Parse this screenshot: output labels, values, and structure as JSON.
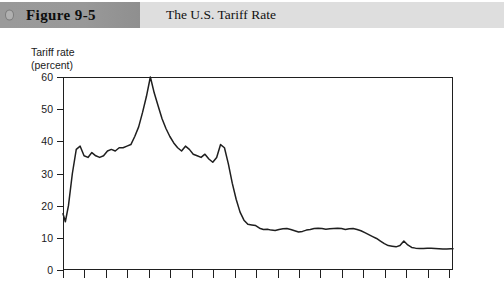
{
  "caption": {
    "figure_label": "Figure 9-5",
    "title": "The U.S. Tariff Rate",
    "band_color": "#999999",
    "title_band_color": "#dedede",
    "dot_icon": "circle-icon"
  },
  "chart_data": {
    "type": "line",
    "title": "The U.S. Tariff Rate",
    "xlabel": "",
    "ylabel": "Tariff rate\n(percent)",
    "ylim": [
      0,
      60
    ],
    "yticks": [
      0,
      10,
      20,
      30,
      40,
      50,
      60
    ],
    "ytick_labels": [
      "0",
      "10",
      "20",
      "30",
      "40",
      "50",
      "60"
    ],
    "xlim": [
      0,
      100
    ],
    "xticks": [
      0,
      5.5,
      11,
      16.5,
      22,
      27.5,
      33,
      38.5,
      44,
      49.5,
      55,
      60.5,
      66,
      71.5,
      77,
      82.5,
      88,
      93.5,
      99
    ],
    "xtick_labels": [],
    "grid": false,
    "legend": null,
    "line_color": "#1f1f1f",
    "x": [
      0.0,
      0.6,
      1.4,
      2.4,
      3.4,
      4.4,
      5.4,
      6.4,
      7.4,
      8.4,
      9.4,
      10.4,
      11.4,
      12.4,
      13.4,
      14.4,
      15.4,
      16.4,
      17.4,
      18.4,
      19.4,
      20.4,
      21.4,
      22.4,
      23.4,
      24.4,
      25.4,
      26.4,
      27.4,
      28.4,
      29.4,
      30.4,
      31.4,
      32.4,
      33.4,
      34.4,
      35.4,
      36.4,
      37.4,
      38.4,
      39.4,
      40.4,
      41.4,
      42.4,
      43.4,
      44.4,
      45.4,
      46.4,
      47.4,
      48.4,
      49.4,
      50.4,
      51.4,
      52.4,
      53.4,
      54.4,
      55.4,
      56.4,
      57.4,
      58.4,
      59.4,
      60.4,
      61.4,
      62.4,
      63.4,
      64.4,
      65.4,
      66.4,
      67.4,
      68.4,
      69.4,
      70.4,
      71.4,
      72.4,
      73.4,
      74.4,
      75.4,
      76.4,
      77.4,
      78.4,
      79.4,
      80.4,
      81.4,
      82.4,
      83.4,
      84.4,
      85.4,
      86.4,
      87.4,
      88.4,
      89.4,
      90.4,
      91.4,
      92.4,
      93.4,
      94.4,
      95.4,
      96.4,
      97.4,
      98.4,
      99.4,
      100.0
    ],
    "values": [
      17.5,
      15.0,
      20.0,
      30.0,
      37.5,
      38.5,
      35.5,
      35.0,
      36.5,
      35.5,
      35.0,
      35.5,
      37.0,
      37.5,
      37.0,
      38.0,
      38.0,
      38.5,
      39.0,
      41.5,
      44.5,
      49.0,
      54.0,
      60.0,
      55.0,
      51.0,
      47.0,
      44.0,
      41.5,
      39.5,
      38.0,
      37.0,
      38.5,
      37.5,
      36.0,
      35.5,
      35.0,
      36.0,
      34.5,
      33.5,
      35.0,
      39.0,
      38.0,
      33.0,
      27.0,
      22.0,
      18.0,
      15.5,
      14.2,
      14.0,
      13.8,
      13.0,
      12.6,
      12.7,
      12.4,
      12.3,
      12.6,
      12.8,
      12.9,
      12.6,
      12.2,
      11.8,
      12.0,
      12.4,
      12.6,
      12.9,
      13.0,
      12.9,
      12.7,
      12.8,
      12.9,
      13.0,
      12.9,
      12.6,
      12.8,
      12.9,
      12.6,
      12.2,
      11.6,
      11.0,
      10.4,
      9.8,
      9.0,
      8.2,
      7.6,
      7.4,
      7.2,
      7.6,
      9.0,
      7.8,
      7.0,
      6.8,
      6.7,
      6.7,
      6.8,
      6.8,
      6.7,
      6.6,
      6.5,
      6.5,
      6.6,
      6.6
    ],
    "annotations": []
  }
}
